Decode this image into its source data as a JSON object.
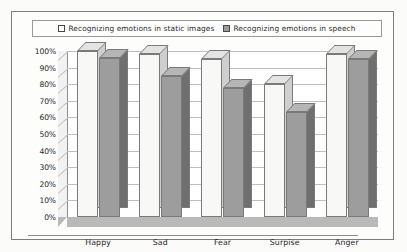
{
  "legend": {
    "entries": [
      {
        "label": "Recognizing emotions in static images",
        "marker": "empty-square-icon",
        "color": "#ffffff"
      },
      {
        "label": "Recognizing emotions in speech",
        "marker": "filled-square-icon",
        "color": "#9c9c9c"
      }
    ]
  },
  "axis": {
    "yticks": [
      "100%",
      "90%",
      "80%",
      "70%",
      "60%",
      "50%",
      "40%",
      "30%",
      "20%",
      "10%",
      "0%"
    ]
  },
  "chart_data": {
    "type": "bar",
    "title": "",
    "subtitle": "",
    "xlabel": "",
    "ylabel": "",
    "ylim": [
      0,
      100
    ],
    "ytick_step": 10,
    "ytick_format": "percent",
    "grid": true,
    "legend_position": "top",
    "style": "3d-grouped-column",
    "categories": [
      "Happy",
      "Sad",
      "Fear",
      "Surpise",
      "Anger"
    ],
    "series": [
      {
        "name": "Recognizing emotions in static images",
        "color": "#f8f8f7",
        "values": [
          100,
          98,
          95,
          80,
          98
        ]
      },
      {
        "name": "Recognizing emotions in speech",
        "color": "#9d9d9d",
        "values": [
          96,
          85,
          78,
          63,
          95
        ]
      }
    ]
  }
}
